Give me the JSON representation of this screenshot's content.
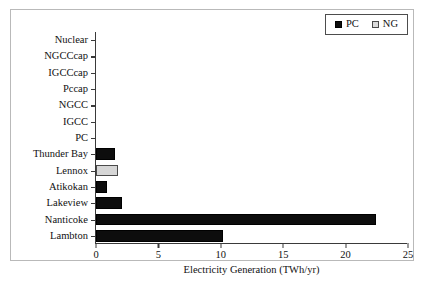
{
  "chart_data": {
    "type": "bar",
    "orientation": "horizontal",
    "title": "",
    "xlabel": "Electricity Generation (TWh/yr)",
    "ylabel": "",
    "xlim": [
      0,
      25
    ],
    "xticks": [
      0,
      5,
      10,
      15,
      20,
      25
    ],
    "xtick_labels": [
      "0",
      "5",
      "10",
      "15",
      "20",
      "25"
    ],
    "grid": false,
    "legend_position": "top-right",
    "categories": [
      "Nuclear",
      "NGCCcap",
      "IGCCcap",
      "Pccap",
      "NGCC",
      "IGCC",
      "PC",
      "Thunder Bay",
      "Lennox",
      "Atikokan",
      "Lakeview",
      "Nanticoke",
      "Lambton"
    ],
    "series": [
      {
        "name": "PC",
        "color": "#0d0d0d",
        "values": [
          0,
          0,
          0,
          0,
          0,
          0,
          0,
          1.5,
          0,
          0.9,
          2.1,
          22.4,
          10.2
        ]
      },
      {
        "name": "NG",
        "color": "#d6d6d6",
        "values": [
          0,
          0,
          0,
          0,
          0,
          0,
          0,
          0,
          1.8,
          0,
          0,
          0,
          0
        ]
      }
    ],
    "bar_assignment": [
      {
        "category": "Nuclear",
        "series": "PC",
        "value": 0
      },
      {
        "category": "NGCCcap",
        "series": "PC",
        "value": 0
      },
      {
        "category": "IGCCcap",
        "series": "PC",
        "value": 0
      },
      {
        "category": "Pccap",
        "series": "PC",
        "value": 0
      },
      {
        "category": "NGCC",
        "series": "PC",
        "value": 0
      },
      {
        "category": "IGCC",
        "series": "PC",
        "value": 0
      },
      {
        "category": "PC",
        "series": "PC",
        "value": 0
      },
      {
        "category": "Thunder Bay",
        "series": "PC",
        "value": 1.5
      },
      {
        "category": "Lennox",
        "series": "NG",
        "value": 1.8
      },
      {
        "category": "Atikokan",
        "series": "PC",
        "value": 0.9
      },
      {
        "category": "Lakeview",
        "series": "PC",
        "value": 2.1
      },
      {
        "category": "Nanticoke",
        "series": "PC",
        "value": 22.4
      },
      {
        "category": "Lambton",
        "series": "PC",
        "value": 10.2
      }
    ]
  },
  "legend": {
    "entries": [
      {
        "label": "PC",
        "color": "#0d0d0d"
      },
      {
        "label": "NG",
        "color": "#d6d6d6"
      }
    ]
  }
}
